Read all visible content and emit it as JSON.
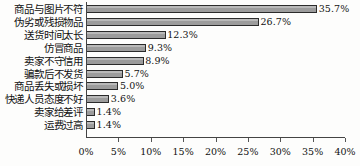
{
  "chart_data": {
    "type": "bar",
    "orientation": "horizontal",
    "title": "",
    "xlabel": "",
    "ylabel": "",
    "xlim": [
      0,
      40
    ],
    "grid": false,
    "legend": null,
    "categories": [
      "商品与图片不符",
      "伪劣或残损物品",
      "送货时间太长",
      "仿冒商品",
      "卖家不守信用",
      "骗款后不发货",
      "商品丢失或损坏",
      "快递人员态度不好",
      "卖家给差评",
      "运费过高"
    ],
    "values": [
      35.7,
      26.7,
      12.3,
      9.3,
      8.9,
      5.7,
      5.0,
      3.6,
      1.4,
      1.4
    ],
    "value_labels": [
      "35.7%",
      "26.7%",
      "12.3%",
      "9.3%",
      "8.9%",
      "5.7%",
      "5.0%",
      "3.6%",
      "1.4%",
      "1.4%"
    ],
    "xticks": [
      0,
      5,
      10,
      15,
      20,
      25,
      30,
      35,
      40
    ],
    "xtick_labels": [
      "0%",
      "5%",
      "10%",
      "15%",
      "20%",
      "25%",
      "30%",
      "35%",
      "40%"
    ],
    "colors": {
      "bar_fill": "#a8a8a8",
      "bar_border": "#2b2b2b",
      "axis": "#444444",
      "text": "#111111",
      "background": "#fdfdfc"
    }
  }
}
